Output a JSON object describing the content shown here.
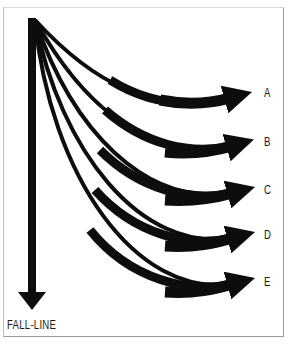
{
  "diagram": {
    "fall_line_label": "FALL-LINE",
    "paths": [
      {
        "label": "A",
        "end_y": 95,
        "path": "M35,20 C95,85 150,112 230,98"
      },
      {
        "label": "B",
        "end_y": 143,
        "path": "M35,20 C85,110 150,160 232,146"
      },
      {
        "label": "C",
        "end_y": 190,
        "path": "M35,20 C72,130 145,207 233,193"
      },
      {
        "label": "D",
        "end_y": 235,
        "path": "M35,20 C60,150 140,253 233,238"
      },
      {
        "label": "E",
        "end_y": 281,
        "path": "M35,20 C50,175 135,298 233,284"
      }
    ],
    "colors": {
      "stroke": "#0d0d0d",
      "frame": "#9a9a9a",
      "background": "#ffffff"
    }
  }
}
